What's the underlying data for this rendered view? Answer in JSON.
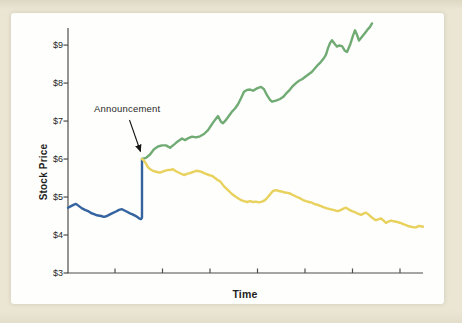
{
  "figure": {
    "background_color": "#ebe6d4",
    "card_color": "#fefefc",
    "axis_color": "#4d4d4d",
    "text_color": "#1f1f1f"
  },
  "labels": {
    "y_axis_title": "Stock Price",
    "x_axis_title": "Time",
    "annotation_text": "Announcement"
  },
  "chart_data": {
    "type": "line",
    "title": "",
    "xlabel": "Time",
    "ylabel": "Stock Price",
    "xlim": [
      0,
      355
    ],
    "ylim": [
      3,
      9.45
    ],
    "grid": false,
    "legend": "none",
    "y_axis": {
      "tick_values": [
        3,
        4,
        5,
        6,
        7,
        8,
        9
      ],
      "tick_labels": [
        "$3",
        "$4",
        "$5",
        "$6",
        "$7",
        "$8",
        "$9"
      ]
    },
    "x_axis": {
      "tick_values": [
        47,
        94.5,
        142,
        189.5,
        237,
        284.5,
        332
      ],
      "tick_labels": []
    },
    "annotation": {
      "text": "Announcement",
      "arrow_start": [
        129.5,
        120
      ],
      "arrow_end": [
        140.5,
        151.5
      ],
      "points_to": "price jump at announcement time (t=74, $6)"
    },
    "series": [
      {
        "name": "blue-pre-announcement-line",
        "color": "#34639f",
        "points": [
          [
            0,
            4.72
          ],
          [
            3,
            4.76
          ],
          [
            6,
            4.8
          ],
          [
            8,
            4.82
          ],
          [
            11,
            4.76
          ],
          [
            14,
            4.7
          ],
          [
            17,
            4.66
          ],
          [
            20,
            4.63
          ],
          [
            23,
            4.58
          ],
          [
            26,
            4.55
          ],
          [
            29,
            4.52
          ],
          [
            33,
            4.5
          ],
          [
            36,
            4.48
          ],
          [
            39,
            4.5
          ],
          [
            41,
            4.53
          ],
          [
            44,
            4.57
          ],
          [
            48,
            4.62
          ],
          [
            51,
            4.66
          ],
          [
            54,
            4.68
          ],
          [
            56,
            4.65
          ],
          [
            59,
            4.61
          ],
          [
            62,
            4.57
          ],
          [
            64,
            4.55
          ],
          [
            67,
            4.51
          ],
          [
            69,
            4.48
          ],
          [
            71,
            4.44
          ],
          [
            73,
            4.42
          ],
          [
            74,
            4.46
          ],
          [
            74,
            6.0
          ]
        ]
      },
      {
        "name": "green-rising-line",
        "color": "#70ab74",
        "points": [
          [
            74,
            6.0
          ],
          [
            78,
            6.03
          ],
          [
            82,
            6.12
          ],
          [
            86,
            6.26
          ],
          [
            90,
            6.33
          ],
          [
            94,
            6.36
          ],
          [
            98,
            6.36
          ],
          [
            102,
            6.3
          ],
          [
            106,
            6.38
          ],
          [
            110,
            6.47
          ],
          [
            114,
            6.54
          ],
          [
            117,
            6.5
          ],
          [
            121,
            6.56
          ],
          [
            124,
            6.59
          ],
          [
            128,
            6.57
          ],
          [
            132,
            6.6
          ],
          [
            136,
            6.66
          ],
          [
            140,
            6.76
          ],
          [
            144,
            6.92
          ],
          [
            147,
            7.03
          ],
          [
            150,
            7.13
          ],
          [
            153,
            6.98
          ],
          [
            155,
            6.94
          ],
          [
            158,
            7.03
          ],
          [
            161,
            7.14
          ],
          [
            164,
            7.25
          ],
          [
            167,
            7.33
          ],
          [
            170,
            7.44
          ],
          [
            173,
            7.6
          ],
          [
            176,
            7.77
          ],
          [
            179,
            7.82
          ],
          [
            182,
            7.83
          ],
          [
            185,
            7.8
          ],
          [
            189,
            7.86
          ],
          [
            193,
            7.9
          ],
          [
            196,
            7.84
          ],
          [
            199,
            7.68
          ],
          [
            202,
            7.56
          ],
          [
            204,
            7.51
          ],
          [
            208,
            7.54
          ],
          [
            212,
            7.58
          ],
          [
            215,
            7.63
          ],
          [
            218,
            7.72
          ],
          [
            221,
            7.8
          ],
          [
            224,
            7.9
          ],
          [
            228,
            8.0
          ],
          [
            231,
            8.06
          ],
          [
            234,
            8.1
          ],
          [
            238,
            8.18
          ],
          [
            241,
            8.24
          ],
          [
            244,
            8.3
          ],
          [
            247,
            8.39
          ],
          [
            250,
            8.48
          ],
          [
            253,
            8.56
          ],
          [
            256,
            8.66
          ],
          [
            258,
            8.75
          ],
          [
            260,
            8.92
          ],
          [
            262,
            9.05
          ],
          [
            264,
            9.13
          ],
          [
            267,
            9.02
          ],
          [
            269,
            8.96
          ],
          [
            271,
            8.99
          ],
          [
            274,
            8.97
          ],
          [
            277,
            8.85
          ],
          [
            279,
            8.82
          ],
          [
            282,
            9.0
          ],
          [
            285,
            9.25
          ],
          [
            287,
            9.39
          ],
          [
            289,
            9.27
          ],
          [
            291,
            9.12
          ],
          [
            294,
            9.22
          ],
          [
            297,
            9.32
          ],
          [
            300,
            9.42
          ],
          [
            302,
            9.48
          ],
          [
            304,
            9.57
          ]
        ]
      },
      {
        "name": "yellow-declining-line",
        "color": "#e8d15c",
        "points": [
          [
            74,
            6.0
          ],
          [
            76,
            5.96
          ],
          [
            78,
            5.88
          ],
          [
            80,
            5.78
          ],
          [
            83,
            5.72
          ],
          [
            85,
            5.69
          ],
          [
            89,
            5.66
          ],
          [
            92,
            5.64
          ],
          [
            96,
            5.68
          ],
          [
            99,
            5.71
          ],
          [
            103,
            5.72
          ],
          [
            105,
            5.73
          ],
          [
            108,
            5.68
          ],
          [
            111,
            5.64
          ],
          [
            114,
            5.6
          ],
          [
            116,
            5.58
          ],
          [
            119,
            5.61
          ],
          [
            122,
            5.63
          ],
          [
            125,
            5.66
          ],
          [
            128,
            5.69
          ],
          [
            131,
            5.68
          ],
          [
            133,
            5.67
          ],
          [
            136,
            5.63
          ],
          [
            138,
            5.61
          ],
          [
            141,
            5.58
          ],
          [
            144,
            5.56
          ],
          [
            147,
            5.5
          ],
          [
            150,
            5.44
          ],
          [
            152,
            5.42
          ],
          [
            156,
            5.28
          ],
          [
            160,
            5.18
          ],
          [
            164,
            5.08
          ],
          [
            167,
            5.02
          ],
          [
            170,
            4.97
          ],
          [
            173,
            4.92
          ],
          [
            176,
            4.89
          ],
          [
            179,
            4.87
          ],
          [
            182,
            4.89
          ],
          [
            185,
            4.87
          ],
          [
            188,
            4.88
          ],
          [
            191,
            4.86
          ],
          [
            194,
            4.88
          ],
          [
            197,
            4.92
          ],
          [
            200,
            5.0
          ],
          [
            203,
            5.1
          ],
          [
            205,
            5.16
          ],
          [
            208,
            5.18
          ],
          [
            211,
            5.16
          ],
          [
            214,
            5.14
          ],
          [
            217,
            5.12
          ],
          [
            220,
            5.11
          ],
          [
            223,
            5.08
          ],
          [
            226,
            5.04
          ],
          [
            229,
            5.0
          ],
          [
            232,
            4.97
          ],
          [
            235,
            4.92
          ],
          [
            238,
            4.89
          ],
          [
            241,
            4.87
          ],
          [
            244,
            4.85
          ],
          [
            247,
            4.81
          ],
          [
            250,
            4.79
          ],
          [
            253,
            4.76
          ],
          [
            256,
            4.73
          ],
          [
            259,
            4.7
          ],
          [
            262,
            4.68
          ],
          [
            265,
            4.66
          ],
          [
            268,
            4.64
          ],
          [
            270,
            4.63
          ],
          [
            273,
            4.66
          ],
          [
            276,
            4.7
          ],
          [
            278,
            4.72
          ],
          [
            281,
            4.67
          ],
          [
            284,
            4.63
          ],
          [
            287,
            4.6
          ],
          [
            290,
            4.56
          ],
          [
            293,
            4.53
          ],
          [
            296,
            4.57
          ],
          [
            298,
            4.59
          ],
          [
            301,
            4.53
          ],
          [
            303,
            4.48
          ],
          [
            306,
            4.42
          ],
          [
            308,
            4.39
          ],
          [
            311,
            4.42
          ],
          [
            313,
            4.44
          ],
          [
            316,
            4.37
          ],
          [
            318,
            4.32
          ],
          [
            321,
            4.36
          ],
          [
            323,
            4.38
          ],
          [
            326,
            4.36
          ],
          [
            328,
            4.35
          ],
          [
            331,
            4.33
          ],
          [
            333,
            4.31
          ],
          [
            336,
            4.28
          ],
          [
            338,
            4.26
          ],
          [
            341,
            4.23
          ],
          [
            343,
            4.22
          ],
          [
            346,
            4.2
          ],
          [
            348,
            4.2
          ],
          [
            351,
            4.24
          ],
          [
            353,
            4.23
          ],
          [
            355,
            4.22
          ]
        ]
      }
    ]
  }
}
